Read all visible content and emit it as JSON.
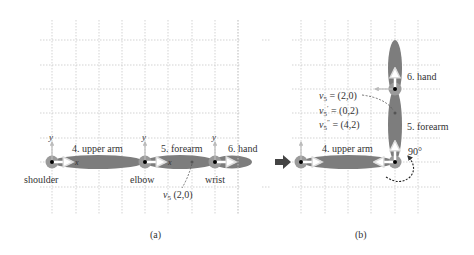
{
  "panels": [
    {
      "caption": "(a)",
      "joints": [
        {
          "name": "shoulder",
          "label": "shoulder"
        },
        {
          "name": "elbow",
          "label": "elbow"
        },
        {
          "name": "wrist",
          "label": "wrist"
        }
      ],
      "limbs": [
        {
          "id": 4,
          "label": "4. upper arm"
        },
        {
          "id": 5,
          "label": "5. forearm"
        },
        {
          "id": 6,
          "label": "6. hand"
        }
      ],
      "axis_labels": {
        "x": "x",
        "y": "y"
      },
      "point_label": "v5 (2,0)",
      "point_label_var": "v",
      "point_label_sub": "5",
      "point_label_coords": " (2,0)"
    },
    {
      "caption": "(b)",
      "limbs": [
        {
          "id": 4,
          "label": "4. upper arm"
        },
        {
          "id": 5,
          "label": "5. forearm"
        },
        {
          "id": 6,
          "label": "6. hand"
        }
      ],
      "rotation_label": "90°",
      "equations": [
        {
          "var": "v",
          "sub": "5",
          "prime": "",
          "rhs": " = (2,0)"
        },
        {
          "var": "v",
          "sub": "5",
          "prime": "′",
          "rhs": " = (0,2)"
        },
        {
          "var": "v",
          "sub": "5",
          "prime": "″",
          "rhs": " = (4,2)"
        }
      ]
    }
  ],
  "colors": {
    "limb": "#7d7d7d",
    "joint_halo": "#9a9a9a",
    "grid": "#c8c8c8",
    "axis": "#b5b5b5",
    "arrow": "#444444",
    "text": "#333333"
  }
}
